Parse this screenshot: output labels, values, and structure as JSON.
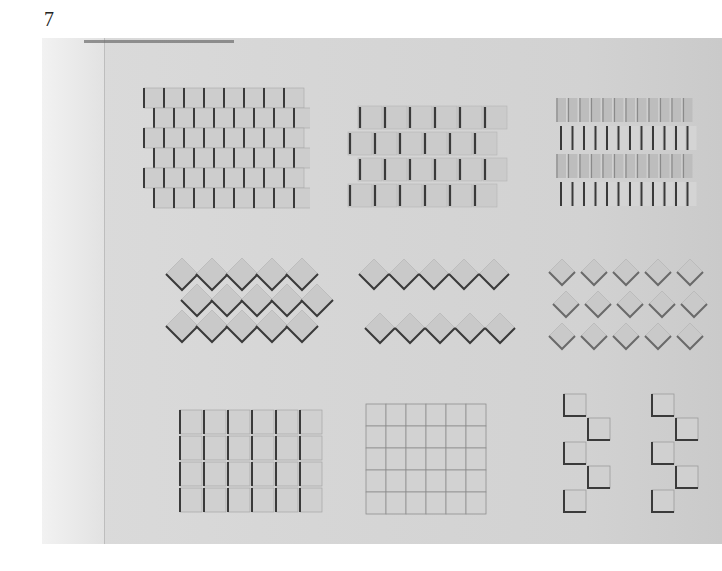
{
  "page": {
    "number": "7"
  },
  "photo": {
    "description": "Relief panel with nine grid samples of tiled/woven square textures",
    "grid": {
      "rows": 3,
      "cols": 3
    },
    "samples": [
      {
        "row": 1,
        "col": 1,
        "pattern": "overlapping woven squares",
        "rows": 6,
        "cols": 8
      },
      {
        "row": 1,
        "col": 2,
        "pattern": "staggered curled tiles",
        "rows": 4,
        "cols": 6
      },
      {
        "row": 1,
        "col": 3,
        "pattern": "narrow vertical slats",
        "rows": 4,
        "cols": 12
      },
      {
        "row": 2,
        "col": 1,
        "pattern": "diamond overlapping scales",
        "rows": 3,
        "cols": 5
      },
      {
        "row": 2,
        "col": 2,
        "pattern": "two bands of diamond tiles",
        "rows": 2,
        "cols": 5
      },
      {
        "row": 2,
        "col": 3,
        "pattern": "spaced diamond tiles",
        "rows": 3,
        "cols": 5
      },
      {
        "row": 3,
        "col": 1,
        "pattern": "square grid of flaps",
        "rows": 4,
        "cols": 6
      },
      {
        "row": 3,
        "col": 2,
        "pattern": "fine square grid",
        "rows": 5,
        "cols": 6
      },
      {
        "row": 3,
        "col": 3,
        "pattern": "checkerboard squares",
        "rows": 5,
        "cols": 4
      }
    ]
  },
  "colors": {
    "background": "#d4d4d4",
    "shadow": "#3a3a3a",
    "tile": "#c9c9c9"
  }
}
